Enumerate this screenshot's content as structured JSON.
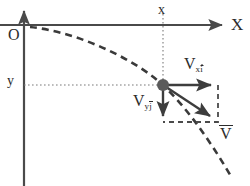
{
  "figure": {
    "background_color": "#ffffff",
    "stroke_color": "#4a4a4a",
    "ink_color": "#2b2b2b",
    "particle_color": "#5a5a5a"
  },
  "axes": {
    "x_axis_label": "X",
    "origin_label": "O",
    "x_axis": {
      "y": 25,
      "x_start": 0,
      "x_end": 225,
      "arrow": "right"
    },
    "y_axis": {
      "x": 24,
      "y_start": 186,
      "y_end": 8,
      "arrow": "up"
    }
  },
  "coordinates": {
    "x_label": "x",
    "y_label": "y",
    "x_guide": {
      "x": 163,
      "y_start": 14,
      "y_end": 85,
      "style": "dotted"
    },
    "y_guide": {
      "y": 85,
      "x_start": 24,
      "x_end": 163,
      "style": "dotted"
    }
  },
  "particle": {
    "name": "projectile-particle",
    "x": 163,
    "y": 85,
    "radius": 6
  },
  "trajectory": {
    "style": "dashed",
    "description": "parabolic projectile path",
    "path": "M 30,27 C 70,31 120,52 152,76 C 178,96 205,132 232,178"
  },
  "vectors": [
    {
      "id": "vx",
      "label_base": "V",
      "label_sub": "x",
      "label_unit": "i",
      "notation": "x-component velocity, x i-hat",
      "from": {
        "x": 163,
        "y": 85
      },
      "to": {
        "x": 215,
        "y": 85
      },
      "direction": "right"
    },
    {
      "id": "vy",
      "label_base": "V",
      "label_sub": "y",
      "label_unit": "j",
      "notation": "y-component velocity, y j-hat",
      "from": {
        "x": 163,
        "y": 85
      },
      "to": {
        "x": 163,
        "y": 120
      },
      "direction": "down"
    },
    {
      "id": "vres",
      "label_base": "V",
      "notation": "resultant velocity vector, V with overbar",
      "from": {
        "x": 163,
        "y": 85
      },
      "to": {
        "x": 214,
        "y": 119
      },
      "direction": "down-right"
    }
  ],
  "component_box": {
    "name": "velocity-component-rectangle",
    "style": "dashed",
    "x": 163,
    "y": 85,
    "width": 55,
    "height": 37
  }
}
